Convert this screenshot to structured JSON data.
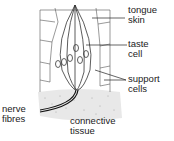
{
  "diagram": {
    "labels": {
      "tongue_skin": [
        "tongue",
        "skin"
      ],
      "taste_cell": [
        "taste",
        "cell"
      ],
      "support_cells": [
        "support",
        "cells"
      ],
      "nerve_fibres": [
        "nerve",
        "fibres"
      ],
      "connective_tissue": [
        "connective",
        "tissue"
      ]
    },
    "colors": {
      "line": "#333333",
      "stipple": "#bbbbbb",
      "background": "#ffffff"
    }
  }
}
